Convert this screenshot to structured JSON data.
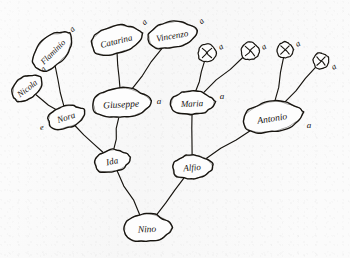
{
  "diagram": {
    "medium": "pen on paper sketch",
    "background_color": "#fbfbfb",
    "ink_color": "#17140f",
    "width": 350,
    "height": 258
  },
  "nodes": [
    {
      "id": "nicola",
      "label": "Nicola",
      "shape": "ellipse",
      "x": 27,
      "y": 88,
      "rx": 17,
      "ry": 11,
      "rotate": -38,
      "font_size": 8.5
    },
    {
      "id": "flaminio",
      "label": "Flaminio",
      "shape": "ellipse",
      "x": 52,
      "y": 51,
      "rx": 24,
      "ry": 14,
      "rotate": -45,
      "font_size": 8.5
    },
    {
      "id": "catarina",
      "label": "Catarina",
      "shape": "ellipse",
      "x": 116,
      "y": 40,
      "rx": 26,
      "ry": 14,
      "rotate": -14,
      "font_size": 9
    },
    {
      "id": "vincenzo",
      "label": "Vincenzo",
      "shape": "ellipse",
      "x": 172,
      "y": 35,
      "rx": 25,
      "ry": 13,
      "rotate": -10,
      "font_size": 9
    },
    {
      "id": "nora",
      "label": "Nora",
      "shape": "ellipse",
      "x": 66,
      "y": 117,
      "rx": 19,
      "ry": 11,
      "rotate": -18,
      "font_size": 9
    },
    {
      "id": "giuseppe",
      "label": "Giuseppe",
      "shape": "ellipse",
      "x": 121,
      "y": 103,
      "rx": 29,
      "ry": 15,
      "rotate": -3,
      "font_size": 9.5
    },
    {
      "id": "maria",
      "label": "Maria",
      "shape": "ellipse",
      "x": 192,
      "y": 103,
      "rx": 22,
      "ry": 12,
      "rotate": -2,
      "font_size": 9
    },
    {
      "id": "antonio",
      "label": "Antonio",
      "shape": "ellipse",
      "x": 272,
      "y": 117,
      "rx": 30,
      "ry": 15,
      "rotate": -9,
      "font_size": 9.5
    },
    {
      "id": "ida",
      "label": "Ida",
      "shape": "ellipse",
      "x": 112,
      "y": 161,
      "rx": 18,
      "ry": 11,
      "rotate": -12,
      "font_size": 9
    },
    {
      "id": "alfio",
      "label": "Alfio",
      "shape": "ellipse",
      "x": 192,
      "y": 167,
      "rx": 20,
      "ry": 12,
      "rotate": -4,
      "font_size": 9
    },
    {
      "id": "nino",
      "label": "Nino",
      "shape": "ellipse",
      "x": 147,
      "y": 228,
      "rx": 24,
      "ry": 14,
      "rotate": -2,
      "font_size": 9.5
    },
    {
      "id": "x1",
      "label": "X",
      "shape": "circle",
      "x": 207,
      "y": 53,
      "rx": 9,
      "ry": 9,
      "rotate": 0,
      "font_size": 8
    },
    {
      "id": "x2",
      "label": "X",
      "shape": "circle",
      "x": 250,
      "y": 51,
      "rx": 9,
      "ry": 9,
      "rotate": 0,
      "font_size": 8
    },
    {
      "id": "x3",
      "label": "X",
      "shape": "circle",
      "x": 285,
      "y": 50,
      "rx": 8,
      "ry": 8,
      "rotate": 0,
      "font_size": 8
    },
    {
      "id": "x4",
      "label": "X",
      "shape": "circle",
      "x": 321,
      "y": 61,
      "rx": 8,
      "ry": 8,
      "rotate": -22,
      "font_size": 8
    }
  ],
  "edges": [
    {
      "id": "nicola-nora",
      "from": "nicola",
      "to": "nora"
    },
    {
      "id": "flaminio-nora",
      "from": "flaminio",
      "to": "nora"
    },
    {
      "id": "catarina-giuseppe",
      "from": "catarina",
      "to": "giuseppe"
    },
    {
      "id": "vincenzo-giuseppe",
      "from": "vincenzo",
      "to": "giuseppe"
    },
    {
      "id": "nora-ida",
      "from": "nora",
      "to": "ida"
    },
    {
      "id": "giuseppe-ida",
      "from": "giuseppe",
      "to": "ida"
    },
    {
      "id": "x1-maria",
      "from": "x1",
      "to": "maria"
    },
    {
      "id": "x2-maria",
      "from": "x2",
      "to": "maria"
    },
    {
      "id": "x3-antonio",
      "from": "x3",
      "to": "antonio"
    },
    {
      "id": "x4-antonio",
      "from": "x4",
      "to": "antonio"
    },
    {
      "id": "maria-alfio",
      "from": "maria",
      "to": "alfio"
    },
    {
      "id": "antonio-alfio",
      "from": "antonio",
      "to": "alfio"
    },
    {
      "id": "ida-nino",
      "from": "ida",
      "to": "nino"
    },
    {
      "id": "alfio-nino",
      "from": "alfio",
      "to": "nino"
    }
  ],
  "annotations": [
    {
      "id": "ann-flaminio",
      "text": "a",
      "x": 74,
      "y": 31,
      "rotate": -45,
      "font_size": 8.5,
      "near": "flaminio"
    },
    {
      "id": "ann-nicola",
      "text": "a",
      "x": 45,
      "y": 71,
      "rotate": -45,
      "font_size": 8.5,
      "near": "nicola"
    },
    {
      "id": "ann-catarina",
      "text": "a",
      "x": 146,
      "y": 24,
      "rotate": -42,
      "font_size": 8.5,
      "near": "catarina"
    },
    {
      "id": "ann-vincenzo",
      "text": "a",
      "x": 203,
      "y": 23,
      "rotate": -42,
      "font_size": 8.5,
      "near": "vincenzo"
    },
    {
      "id": "ann-nora",
      "text": "e",
      "x": 42,
      "y": 130,
      "rotate": -8,
      "font_size": 8.5,
      "near": "nora"
    },
    {
      "id": "ann-giuseppe",
      "text": "a",
      "x": 159,
      "y": 104,
      "rotate": 0,
      "font_size": 9,
      "near": "giuseppe"
    },
    {
      "id": "ann-maria",
      "text": "a",
      "x": 222,
      "y": 99,
      "rotate": 0,
      "font_size": 9,
      "near": "maria"
    },
    {
      "id": "ann-antonio",
      "text": "a",
      "x": 309,
      "y": 128,
      "rotate": 0,
      "font_size": 9,
      "near": "antonio"
    },
    {
      "id": "ann-x1",
      "text": "a",
      "x": 222,
      "y": 49,
      "rotate": -30,
      "font_size": 8.5,
      "near": "x1"
    },
    {
      "id": "ann-x2",
      "text": "a",
      "x": 265,
      "y": 49,
      "rotate": -30,
      "font_size": 8.5,
      "near": "x2"
    },
    {
      "id": "ann-x3",
      "text": "a",
      "x": 299,
      "y": 46,
      "rotate": -30,
      "font_size": 8.5,
      "near": "x3"
    },
    {
      "id": "ann-x4",
      "text": "a",
      "x": 335,
      "y": 69,
      "rotate": -30,
      "font_size": 8.5,
      "near": "x4"
    }
  ]
}
